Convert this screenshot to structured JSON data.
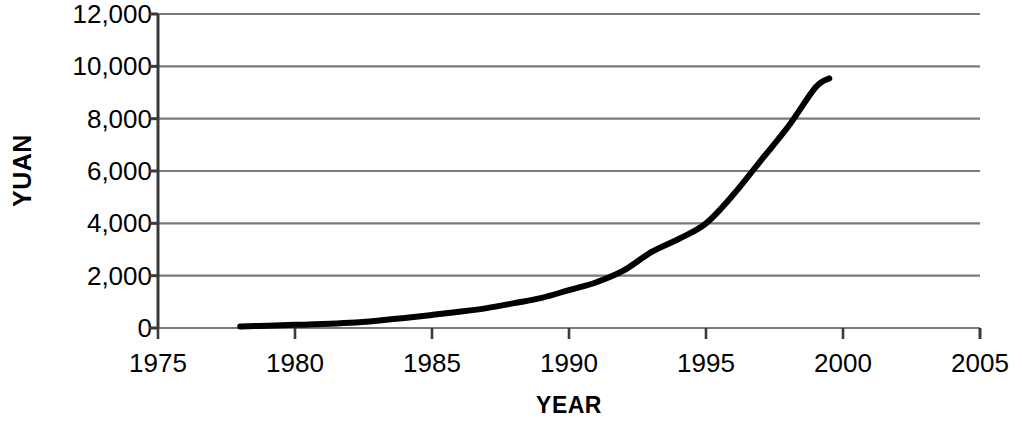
{
  "chart_data": {
    "type": "line",
    "title": "",
    "xlabel": "YEAR",
    "ylabel": "YUAN",
    "xlim": [
      1975,
      2005
    ],
    "ylim": [
      0,
      12000
    ],
    "grid": "horizontal",
    "legend": "none",
    "x_ticks": [
      "1975",
      "1980",
      "1985",
      "1990",
      "1995",
      "2000",
      "2005"
    ],
    "x_tick_values": [
      1975,
      1980,
      1985,
      1990,
      1995,
      2000,
      2005
    ],
    "y_ticks": [
      "0",
      "2,000",
      "4,000",
      "6,000",
      "8,000",
      "10,000",
      "12,000"
    ],
    "y_tick_values": [
      0,
      2000,
      4000,
      6000,
      8000,
      10000,
      12000
    ],
    "series": [
      {
        "name": "YUAN",
        "color": "#000000",
        "line_width": 6,
        "x": [
          1978,
          1979,
          1980,
          1981,
          1982,
          1983,
          1984,
          1985,
          1986,
          1987,
          1988,
          1989,
          1990,
          1991,
          1992,
          1993,
          1994,
          1995,
          1996,
          1997,
          1998,
          1999,
          1999.5
        ],
        "values": [
          60,
          90,
          120,
          150,
          200,
          280,
          380,
          500,
          620,
          760,
          950,
          1150,
          1450,
          1750,
          2200,
          2900,
          3400,
          4000,
          5100,
          6400,
          7700,
          9200,
          9540
        ]
      }
    ]
  },
  "axis_titles": {
    "y": "YUAN",
    "x": "YEAR"
  },
  "style": {
    "line_color": "#000000",
    "grid_color": "#7a7a7a",
    "axis_color": "#3a3a3a",
    "background": "#ffffff"
  }
}
